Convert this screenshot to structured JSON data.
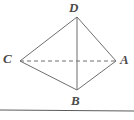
{
  "figure": {
    "name": "quadrilateral-diagram",
    "type": "geometry-line-diagram",
    "background_color": "#ffffff",
    "stroke_color": "#6e6e6e",
    "label_color": "#4a4a4a",
    "labels": {
      "top": "D",
      "left": "C",
      "right": "A",
      "bottom": "B"
    },
    "vertices": [
      {
        "id": "D",
        "label": "D",
        "x": 77,
        "y": 17
      },
      {
        "id": "C",
        "label": "C",
        "x": 20,
        "y": 61
      },
      {
        "id": "A",
        "label": "A",
        "x": 116,
        "y": 61
      },
      {
        "id": "B",
        "label": "B",
        "x": 77,
        "y": 90
      }
    ],
    "edges": [
      {
        "id": "DC",
        "from": "D",
        "to": "C",
        "style": "solid"
      },
      {
        "id": "DA",
        "from": "D",
        "to": "A",
        "style": "solid"
      },
      {
        "id": "CB",
        "from": "C",
        "to": "B",
        "style": "solid"
      },
      {
        "id": "AB",
        "from": "A",
        "to": "B",
        "style": "solid"
      },
      {
        "id": "DB",
        "from": "D",
        "to": "B",
        "style": "solid"
      },
      {
        "id": "CA",
        "from": "C",
        "to": "A",
        "style": "dashed"
      }
    ],
    "ground_line": {
      "id": "ground-line",
      "x1": 0,
      "y1": 110,
      "x2": 134,
      "y2": 111
    }
  }
}
